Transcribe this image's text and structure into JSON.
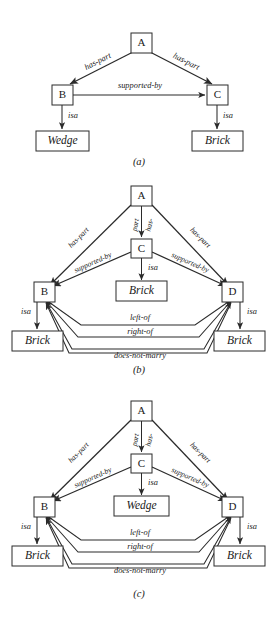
{
  "figures": [
    {
      "id": "a",
      "caption": "(a)",
      "nodes": [
        {
          "id": "A",
          "label": "A",
          "kind": "node"
        },
        {
          "id": "B",
          "label": "B",
          "kind": "node"
        },
        {
          "id": "C",
          "label": "C",
          "kind": "node"
        },
        {
          "id": "wedge",
          "label": "Wedge",
          "kind": "leaf"
        },
        {
          "id": "brick",
          "label": "Brick",
          "kind": "leaf"
        }
      ],
      "edges": [
        {
          "from": "A",
          "to": "B",
          "label": "has-part"
        },
        {
          "from": "A",
          "to": "C",
          "label": "has-part"
        },
        {
          "from": "B",
          "to": "C",
          "label": "supported-by"
        },
        {
          "from": "B",
          "to": "wedge",
          "label": "isa"
        },
        {
          "from": "C",
          "to": "brick",
          "label": "isa"
        }
      ]
    },
    {
      "id": "b",
      "caption": "(b)",
      "nodes": [
        {
          "id": "A",
          "label": "A",
          "kind": "node"
        },
        {
          "id": "B",
          "label": "B",
          "kind": "node"
        },
        {
          "id": "C",
          "label": "C",
          "kind": "node"
        },
        {
          "id": "D",
          "label": "D",
          "kind": "node"
        },
        {
          "id": "brickC",
          "label": "Brick",
          "kind": "leaf"
        },
        {
          "id": "brickB",
          "label": "Brick",
          "kind": "leaf"
        },
        {
          "id": "brickD",
          "label": "Brick",
          "kind": "leaf"
        }
      ],
      "edges": [
        {
          "from": "A",
          "to": "B",
          "label": "has-part"
        },
        {
          "from": "A",
          "to": "C",
          "label": "has-part",
          "label_line1": "has-",
          "label_line2": "part"
        },
        {
          "from": "A",
          "to": "D",
          "label": "has-part"
        },
        {
          "from": "C",
          "to": "B",
          "label": "supported-by"
        },
        {
          "from": "C",
          "to": "D",
          "label": "supported-by"
        },
        {
          "from": "C",
          "to": "brickC",
          "label": "isa"
        },
        {
          "from": "B",
          "to": "brickB",
          "label": "isa"
        },
        {
          "from": "D",
          "to": "brickD",
          "label": "isa"
        },
        {
          "from": "B",
          "to": "D",
          "label": "left-of"
        },
        {
          "from": "D",
          "to": "B",
          "label": "right-of"
        },
        {
          "from": "B",
          "to": "D",
          "label": "does-not-marry"
        }
      ]
    },
    {
      "id": "c",
      "caption": "(c)",
      "nodes": [
        {
          "id": "A",
          "label": "A",
          "kind": "node"
        },
        {
          "id": "B",
          "label": "B",
          "kind": "node"
        },
        {
          "id": "C",
          "label": "C",
          "kind": "node"
        },
        {
          "id": "D",
          "label": "D",
          "kind": "node"
        },
        {
          "id": "wedgeC",
          "label": "Wedge",
          "kind": "leaf"
        },
        {
          "id": "brickB",
          "label": "Brick",
          "kind": "leaf"
        },
        {
          "id": "brickD",
          "label": "Brick",
          "kind": "leaf"
        }
      ],
      "edges": [
        {
          "from": "A",
          "to": "B",
          "label": "has-part"
        },
        {
          "from": "A",
          "to": "C",
          "label": "has-part",
          "label_line1": "has-",
          "label_line2": "part"
        },
        {
          "from": "A",
          "to": "D",
          "label": "has-part"
        },
        {
          "from": "C",
          "to": "B",
          "label": "supported-by"
        },
        {
          "from": "C",
          "to": "D",
          "label": "supported-by"
        },
        {
          "from": "C",
          "to": "wedgeC",
          "label": "isa"
        },
        {
          "from": "B",
          "to": "brickB",
          "label": "isa"
        },
        {
          "from": "D",
          "to": "brickD",
          "label": "isa"
        },
        {
          "from": "B",
          "to": "D",
          "label": "left-of"
        },
        {
          "from": "D",
          "to": "B",
          "label": "right-of"
        },
        {
          "from": "B",
          "to": "D",
          "label": "does-not-marry"
        }
      ]
    }
  ],
  "colors": {
    "ink": "#2b2b2b",
    "text": "#1a1a1a",
    "paper": "#ffffff"
  }
}
